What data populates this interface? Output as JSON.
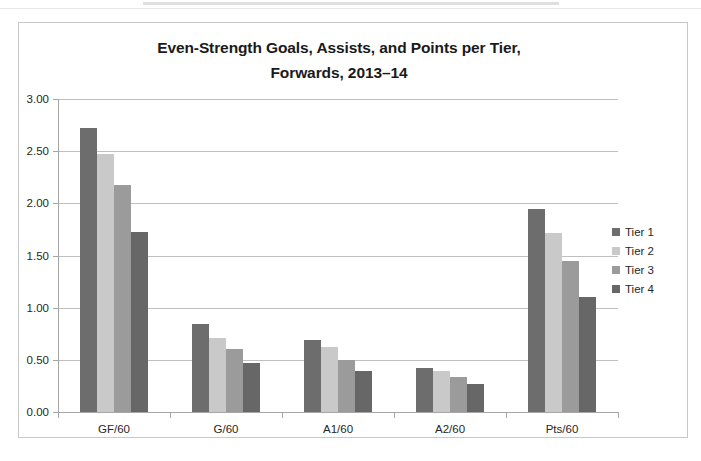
{
  "chart_data": {
    "type": "bar",
    "title": "Even-Strength Goals, Assists, and Points per Tier, Forwards, 2013–14",
    "title_lines": [
      "Even-Strength Goals, Assists, and Points per Tier,",
      "Forwards, 2013–14"
    ],
    "xlabel": "",
    "ylabel": "",
    "ylim": [
      0,
      3
    ],
    "ytick_step": 0.5,
    "ytick_labels": [
      "0.00",
      "0.50",
      "1.00",
      "1.50",
      "2.00",
      "2.50",
      "3.00"
    ],
    "ytick_values": [
      0,
      0.5,
      1.0,
      1.5,
      2.0,
      2.5,
      3.0
    ],
    "grid": true,
    "legend_position": "right",
    "categories": [
      "GF/60",
      "G/60",
      "A1/60",
      "A2/60",
      "Pts/60"
    ],
    "series": [
      {
        "name": "Tier 1",
        "color": "#6d6d6d",
        "values": [
          2.72,
          0.84,
          0.69,
          0.42,
          1.95
        ]
      },
      {
        "name": "Tier 2",
        "color": "#c9c9c9",
        "values": [
          2.47,
          0.71,
          0.62,
          0.39,
          1.72
        ]
      },
      {
        "name": "Tier 3",
        "color": "#9b9b9b",
        "values": [
          2.18,
          0.6,
          0.5,
          0.34,
          1.45
        ]
      },
      {
        "name": "Tier 4",
        "color": "#676767",
        "values": [
          1.73,
          0.47,
          0.39,
          0.27,
          1.1
        ]
      }
    ]
  },
  "legend": {
    "items": [
      {
        "label": "Tier 1",
        "color": "#6d6d6d"
      },
      {
        "label": "Tier 2",
        "color": "#c9c9c9"
      },
      {
        "label": "Tier 3",
        "color": "#9b9b9b"
      },
      {
        "label": "Tier 4",
        "color": "#676767"
      }
    ]
  },
  "style": {
    "frame_border": "#c8c8c8",
    "gridline": "#bfbfbf",
    "axis": "#a6a6a6",
    "text": "#262626",
    "title_text": "#1a1a1a",
    "background": "#ffffff"
  }
}
